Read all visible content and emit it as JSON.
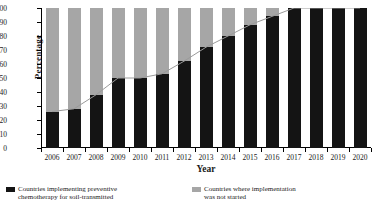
{
  "chart_data": {
    "type": "bar",
    "title": "",
    "subtitle": "",
    "xlabel": "Year",
    "ylabel": "Percentage",
    "ylim": [
      0,
      100
    ],
    "yticks": [
      0,
      10,
      20,
      30,
      40,
      50,
      60,
      70,
      80,
      90,
      100
    ],
    "grid": false,
    "stacked": true,
    "legend_position": "bottom",
    "categories": [
      "2006",
      "2007",
      "2008",
      "2009",
      "2010",
      "2011",
      "2012",
      "2013",
      "2014",
      "2015",
      "2016",
      "2017",
      "2018",
      "2019",
      "2020"
    ],
    "series": [
      {
        "name": "Countries implementing preventive chemotherapy for soil-transmitted helminthiasis",
        "color": "#141414",
        "values": [
          26,
          28,
          38,
          50,
          50,
          53,
          62,
          72,
          80,
          88,
          94,
          100,
          100,
          100,
          100
        ]
      },
      {
        "name": "Countries where implementation was not started",
        "color": "#a6a6a6",
        "values": [
          74,
          72,
          62,
          50,
          50,
          47,
          38,
          28,
          20,
          12,
          6,
          0,
          0,
          0,
          0
        ]
      }
    ],
    "trend_line": {
      "name": "trend",
      "color": "#9a9a9a",
      "values": [
        26,
        28,
        38,
        50,
        50,
        53,
        62,
        72,
        80,
        88,
        94,
        100,
        100,
        100,
        100
      ]
    }
  },
  "legend": {
    "items": [
      {
        "swatch": "sw-black",
        "line1": "Countries implementing preventive",
        "line2": "chemotherapy for soil-transmitted"
      },
      {
        "swatch": "sw-gray",
        "line1": "Countries where implementation",
        "line2": "was not started"
      }
    ]
  }
}
